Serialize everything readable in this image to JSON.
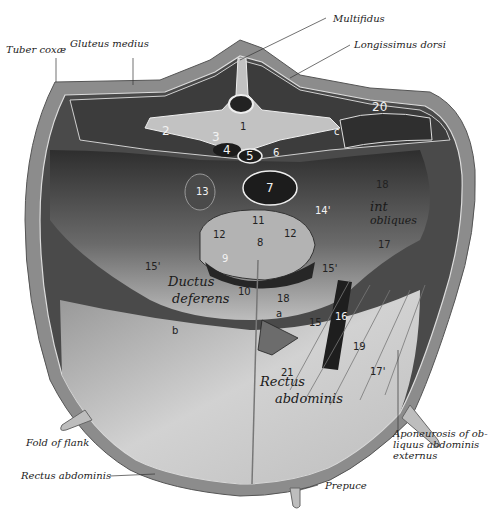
{
  "figure": {
    "labels": {
      "tuber_coxae": "Tuber coxæ",
      "gluteus_medius": "Gluteus medius",
      "multifidus": "Multifidus",
      "longissimus_dorsi": "Longissimus dorsi",
      "fold_of_flank": "Fold of flank",
      "rectus_abdominis": "Rectus abdominis",
      "prepuce": "Prepuce",
      "aponeurosis": "Aponeurosis of ob- liquus abdominis externus"
    },
    "numbers": {
      "n1": "1",
      "n2": "2",
      "n3": "3",
      "n4": "4",
      "n5": "5",
      "n6": "6",
      "n7": "7",
      "n8": "8",
      "n9": "9",
      "n10": "10",
      "n11": "11",
      "n12a": "12",
      "n12b": "12",
      "n13": "13",
      "n14": "14'",
      "n15a": "15'",
      "n15b": "15'",
      "n15c": "15",
      "n16": "16",
      "n17a": "17",
      "n17b": "17'",
      "n18a": "18",
      "n18b": "18",
      "n19": "19",
      "n20": "20",
      "n21": "21",
      "a": "a",
      "b": "b",
      "c": "c"
    },
    "handwritten": {
      "ductus": "Ductus",
      "deferens": "deferens",
      "int_obliquus_1": "int",
      "int_obliquus_2": "obliques",
      "rectus": "Rectus",
      "abdominis": "abdominis"
    },
    "colors": {
      "skin": "#8a8a8a",
      "muscle_dark": "#3a3a3a",
      "cavity": "#555555",
      "bone": "#c8c8c8",
      "aponeurosis": "#d6d6d6",
      "background": "#ffffff"
    }
  }
}
